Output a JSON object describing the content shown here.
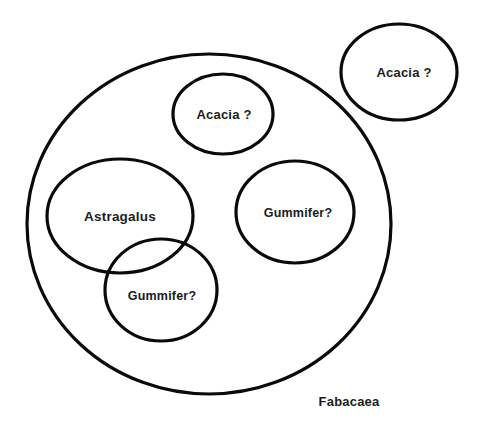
{
  "diagram": {
    "type": "euler-venn",
    "set_labels": {
      "fabacaea": "Fabacaea",
      "acacia_outside": "Acacia ?",
      "acacia_inside": "Acacia ?",
      "astragalus": "Astragalus",
      "gummifer_right": "Gummifer?",
      "gummifer_overlap": "Gummifer?"
    },
    "circles": [
      {
        "id": "fabacaea",
        "cx": 209,
        "cy": 224,
        "rx": 182,
        "ry": 170
      },
      {
        "id": "acacia_outside",
        "cx": 399,
        "cy": 72,
        "rx": 58,
        "ry": 48
      },
      {
        "id": "acacia_inside",
        "cx": 223,
        "cy": 114,
        "rx": 50,
        "ry": 40
      },
      {
        "id": "astragalus",
        "cx": 120,
        "cy": 216,
        "rx": 73,
        "ry": 57
      },
      {
        "id": "gummifer_right",
        "cx": 295,
        "cy": 212,
        "rx": 59,
        "ry": 51
      },
      {
        "id": "gummifer_overlap",
        "cx": 161,
        "cy": 290,
        "rx": 56,
        "ry": 51
      }
    ],
    "stroke_color": "#0a0a0a",
    "text_color": "#1c1c1c",
    "background": "#ffffff"
  }
}
